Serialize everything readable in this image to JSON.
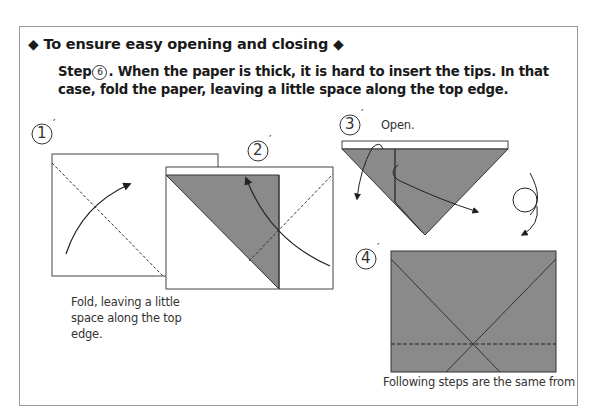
{
  "heading": {
    "left_marker": "◆",
    "title": "To ensure easy opening and closing",
    "right_marker": "◆"
  },
  "instruction": {
    "step_prefix": "Step",
    "step_number": "6",
    "text": ".  When the paper is thick, it is hard to insert the tips. In that case, fold the paper, leaving a little space along the top edge."
  },
  "diagrams": [
    {
      "id": "step-1-prime",
      "label": "1",
      "caption": "Fold, leaving a little space along the top edge."
    },
    {
      "id": "step-2-prime",
      "label": "2",
      "caption": ""
    },
    {
      "id": "step-3-prime",
      "label": "3",
      "caption": "Open."
    },
    {
      "id": "step-4-prime",
      "label": "4",
      "caption": "Following steps are the same from"
    }
  ],
  "colors": {
    "paper_fill": "#8a8a8a",
    "line": "#333333",
    "frame_border": "#9a9a9a"
  }
}
